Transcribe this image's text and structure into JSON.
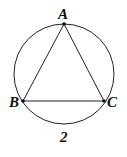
{
  "diagram": {
    "type": "inscribed-triangle-in-circle",
    "circle": {
      "cx": 64,
      "cy": 74,
      "r": 50
    },
    "points": [
      {
        "name": "A",
        "x": 64,
        "y": 24
      },
      {
        "name": "B",
        "x": 23,
        "y": 101
      },
      {
        "name": "C",
        "x": 104,
        "y": 101
      }
    ],
    "labels": {
      "A": "A",
      "B": "B",
      "C": "C",
      "caption": "2"
    },
    "colors": {
      "stroke": "#222222",
      "background": "#ffffff"
    }
  }
}
